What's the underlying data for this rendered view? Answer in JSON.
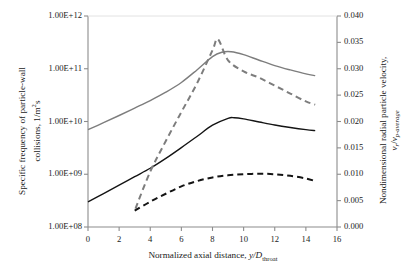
{
  "chart_data": {
    "type": "line",
    "title": "",
    "xlabel": "Normalized axial distance, y/D_throat",
    "ylabel": "Specific frequency of particle-wall collisions, 1/m^2 s",
    "y2label": "Nondimensional radial particle velocity, v_r/v_p-average",
    "xlim": [
      0,
      16
    ],
    "ylim": [
      100000000,
      1000000000000
    ],
    "yscale": "log",
    "y2lim": [
      0.0,
      0.04
    ],
    "grid": false,
    "legend": "none",
    "xticks": [
      0,
      2,
      4,
      6,
      8,
      10,
      12,
      14,
      16
    ],
    "xtick_labels": [
      "0",
      "2",
      "4",
      "6",
      "8",
      "10",
      "12",
      "14",
      "16"
    ],
    "yticks": [
      100000000,
      1000000000,
      10000000000,
      100000000000,
      1000000000000
    ],
    "ytick_labels": [
      "1.00E+08",
      "1.00E+09",
      "1.00E+10",
      "1.00E+11",
      "1.00E+12"
    ],
    "y2ticks": [
      0.0,
      0.005,
      0.01,
      0.015,
      0.02,
      0.025,
      0.03,
      0.035,
      0.04
    ],
    "y2tick_labels": [
      "0.000",
      "0.005",
      "0.010",
      "0.015",
      "0.020",
      "0.025",
      "0.030",
      "0.035",
      "0.040"
    ],
    "series": [
      {
        "name": "gray-solid-collision-frequency",
        "style": "solid",
        "color": "#7d7d7d",
        "axis": "left",
        "x": [
          0,
          1,
          2,
          3,
          4,
          5,
          6,
          7,
          8,
          8.6,
          9.2,
          10,
          11,
          12,
          13,
          14,
          14.6
        ],
        "values": [
          7000000000.0,
          9500000000.0,
          13000000000.0,
          18000000000.0,
          25000000000.0,
          36000000000.0,
          55000000000.0,
          95000000000.0,
          170000000000.0,
          205000000000.0,
          210000000000.0,
          185000000000.0,
          145000000000.0,
          115000000000.0,
          95000000000.0,
          80000000000.0,
          74000000000.0
        ]
      },
      {
        "name": "black-solid-collision-frequency",
        "style": "solid",
        "color": "#141414",
        "axis": "left",
        "x": [
          0,
          1,
          2,
          3,
          4,
          5,
          6,
          7,
          8,
          9,
          9.4,
          10,
          11,
          12,
          13,
          14,
          14.6
        ],
        "values": [
          300000000.0,
          430000000.0,
          620000000.0,
          900000000.0,
          1300000000.0,
          2000000000.0,
          3200000000.0,
          5200000000.0,
          8500000000.0,
          11500000000.0,
          11800000000.0,
          11200000000.0,
          9800000000.0,
          8600000000.0,
          7700000000.0,
          7000000000.0,
          6700000000.0
        ]
      },
      {
        "name": "gray-dashed-radial-velocity",
        "style": "dashed",
        "color": "#7d7d7d",
        "axis": "right",
        "x": [
          3.05,
          4,
          5,
          6,
          7,
          8,
          8.35,
          9,
          10,
          11,
          12,
          13,
          14,
          14.6
        ],
        "values": [
          0.0035,
          0.0105,
          0.0163,
          0.0218,
          0.0272,
          0.0335,
          0.0356,
          0.0316,
          0.0295,
          0.0283,
          0.0268,
          0.0253,
          0.0238,
          0.0232
        ]
      },
      {
        "name": "black-dashed-radial-velocity",
        "style": "dashed",
        "color": "#141414",
        "axis": "right",
        "x": [
          3.0,
          4,
          5,
          6,
          7,
          8,
          9,
          10,
          11,
          12,
          13,
          14,
          14.6
        ],
        "values": [
          0.0031,
          0.0048,
          0.0063,
          0.0077,
          0.0087,
          0.0094,
          0.0098,
          0.01,
          0.0101,
          0.01,
          0.0097,
          0.0092,
          0.0087
        ]
      }
    ]
  },
  "axes": {
    "x_title_prefix": "Normalized axial distance, ",
    "x_title_var": "y/D",
    "x_title_sub": "throat",
    "left_title_line1": "Specific frequency of particle-wall",
    "left_title_line2a": "collisions, 1/m",
    "left_title_sup": "2",
    "left_title_line2b": "s",
    "right_title_main": "Nondimensional radial particle velocity,",
    "right_title_var_a": "v",
    "right_title_sub_a": "r",
    "right_title_slash": "/",
    "right_title_var_b": "v",
    "right_title_sub_b": "p-average"
  }
}
